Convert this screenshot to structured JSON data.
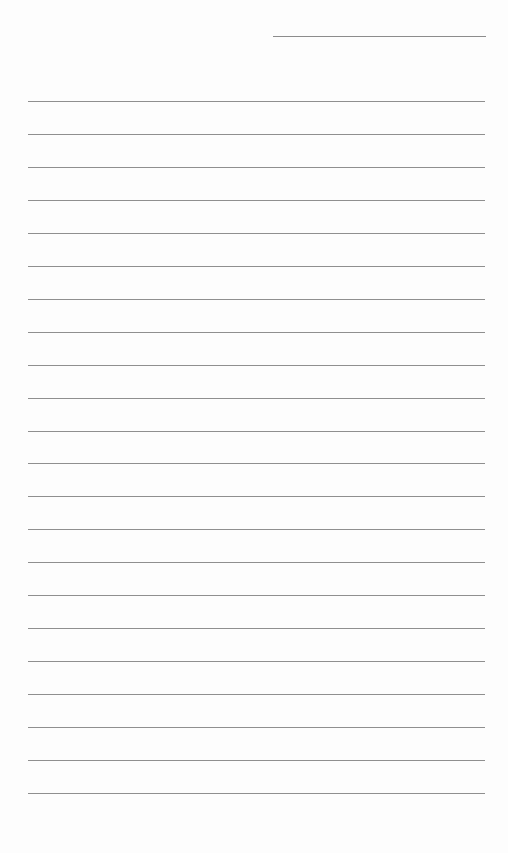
{
  "page": {
    "type": "lined-paper",
    "background_color": "#fdfdfd",
    "line_color": "#8f8f8f"
  },
  "header_line": {
    "label": "",
    "x": 273,
    "y": 36,
    "width": 213
  },
  "ruled_lines": {
    "count": 22,
    "first_y": 101,
    "spacing": 32.95,
    "x": 28,
    "width": 457
  }
}
